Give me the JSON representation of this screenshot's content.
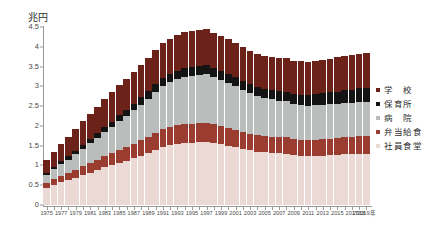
{
  "chart_data": {
    "type": "bar",
    "stacked": true,
    "title": "",
    "subtitle": "",
    "unit_label": "兆円",
    "xlabel": "年",
    "ylabel": "兆円",
    "ylim": [
      0,
      4.5
    ],
    "ytick_labels": [
      "4.5",
      "4",
      "3.5",
      "3",
      "2.5",
      "2",
      "1.5",
      "1",
      "0.5",
      "0"
    ],
    "ytick_values": [
      4.5,
      4,
      3.5,
      3,
      2.5,
      2,
      1.5,
      1,
      0.5,
      0
    ],
    "grid": false,
    "legend_position": "right",
    "x": [
      1975,
      1976,
      1977,
      1978,
      1979,
      1980,
      1981,
      1982,
      1983,
      1984,
      1985,
      1986,
      1987,
      1988,
      1989,
      1990,
      1991,
      1992,
      1993,
      1994,
      1995,
      1996,
      1997,
      1998,
      1999,
      2000,
      2001,
      2002,
      2003,
      2004,
      2005,
      2006,
      2007,
      2008,
      2009,
      2010,
      2011,
      2012,
      2013,
      2014,
      2015,
      2016,
      2017,
      2018,
      2019
    ],
    "xtick_labels": [
      "1975",
      "1977",
      "1979",
      "1981",
      "1983",
      "1985",
      "1987",
      "1989",
      "1991",
      "1993",
      "1995",
      "1997",
      "1999",
      "2001",
      "2003",
      "2005",
      "2007",
      "2009",
      "2011",
      "2013",
      "2015",
      "2017",
      "2018",
      "2019年"
    ],
    "xtick_values": [
      1975,
      1977,
      1979,
      1981,
      1983,
      1985,
      1987,
      1989,
      1991,
      1993,
      1995,
      1997,
      1999,
      2001,
      2003,
      2005,
      2007,
      2009,
      2011,
      2013,
      2015,
      2017,
      2018,
      2019
    ],
    "series": [
      {
        "name": "社員食堂",
        "color": "#ead9d4",
        "values": [
          0.42,
          0.5,
          0.57,
          0.62,
          0.68,
          0.75,
          0.82,
          0.88,
          0.95,
          1.0,
          1.07,
          1.12,
          1.18,
          1.25,
          1.32,
          1.4,
          1.47,
          1.52,
          1.55,
          1.57,
          1.58,
          1.59,
          1.6,
          1.57,
          1.54,
          1.5,
          1.46,
          1.42,
          1.38,
          1.35,
          1.33,
          1.32,
          1.31,
          1.3,
          1.26,
          1.25,
          1.24,
          1.24,
          1.25,
          1.26,
          1.27,
          1.28,
          1.29,
          1.3,
          1.3
        ]
      },
      {
        "name": "弁当給食",
        "color": "#9b3c30",
        "values": [
          0.13,
          0.15,
          0.17,
          0.19,
          0.21,
          0.23,
          0.25,
          0.27,
          0.29,
          0.31,
          0.33,
          0.35,
          0.37,
          0.39,
          0.41,
          0.43,
          0.45,
          0.46,
          0.47,
          0.47,
          0.48,
          0.48,
          0.48,
          0.47,
          0.46,
          0.45,
          0.44,
          0.43,
          0.42,
          0.42,
          0.41,
          0.41,
          0.41,
          0.41,
          0.4,
          0.4,
          0.4,
          0.41,
          0.41,
          0.42,
          0.42,
          0.43,
          0.43,
          0.44,
          0.44
        ]
      },
      {
        "name": "病院",
        "color": "#b9bdbc",
        "values": [
          0.22,
          0.26,
          0.3,
          0.34,
          0.39,
          0.44,
          0.49,
          0.54,
          0.6,
          0.66,
          0.72,
          0.78,
          0.84,
          0.9,
          0.96,
          1.02,
          1.08,
          1.12,
          1.16,
          1.19,
          1.21,
          1.22,
          1.22,
          1.2,
          1.17,
          1.14,
          1.1,
          1.06,
          1.02,
          0.99,
          0.96,
          0.94,
          0.92,
          0.91,
          0.89,
          0.88,
          0.87,
          0.87,
          0.87,
          0.87,
          0.87,
          0.87,
          0.87,
          0.87,
          0.87
        ]
      },
      {
        "name": "保育所",
        "color": "#141414",
        "values": [
          0.05,
          0.06,
          0.07,
          0.08,
          0.09,
          0.1,
          0.11,
          0.12,
          0.13,
          0.14,
          0.15,
          0.16,
          0.17,
          0.18,
          0.19,
          0.2,
          0.21,
          0.22,
          0.22,
          0.23,
          0.23,
          0.23,
          0.23,
          0.23,
          0.23,
          0.23,
          0.23,
          0.23,
          0.23,
          0.23,
          0.23,
          0.24,
          0.24,
          0.25,
          0.25,
          0.26,
          0.27,
          0.28,
          0.29,
          0.3,
          0.31,
          0.32,
          0.33,
          0.34,
          0.35
        ]
      },
      {
        "name": "学　校",
        "color": "#6d2219",
        "values": [
          0.32,
          0.38,
          0.44,
          0.5,
          0.55,
          0.6,
          0.64,
          0.68,
          0.71,
          0.74,
          0.76,
          0.78,
          0.8,
          0.82,
          0.84,
          0.86,
          0.88,
          0.89,
          0.9,
          0.91,
          0.91,
          0.91,
          0.91,
          0.89,
          0.88,
          0.87,
          0.86,
          0.85,
          0.84,
          0.84,
          0.84,
          0.84,
          0.84,
          0.84,
          0.84,
          0.84,
          0.84,
          0.84,
          0.85,
          0.85,
          0.86,
          0.86,
          0.87,
          0.87,
          0.88
        ]
      }
    ],
    "totals": [
      1.14,
      1.35,
      1.55,
      1.73,
      1.92,
      2.12,
      2.31,
      2.49,
      2.68,
      2.85,
      3.03,
      3.19,
      3.36,
      3.54,
      3.72,
      3.91,
      4.09,
      4.21,
      4.3,
      4.37,
      4.41,
      4.43,
      4.44,
      4.36,
      4.28,
      4.19,
      4.09,
      3.99,
      3.89,
      3.83,
      3.77,
      3.75,
      3.72,
      3.71,
      3.64,
      3.63,
      3.62,
      3.64,
      3.67,
      3.7,
      3.73,
      3.76,
      3.79,
      3.82,
      3.84
    ]
  },
  "legend": {
    "items": [
      {
        "label": "学　校",
        "color": "#6d2219"
      },
      {
        "label": "保育所",
        "color": "#141414"
      },
      {
        "label": "病　院",
        "color": "#b9bdbc"
      },
      {
        "label": "弁当給食",
        "color": "#9b3c30"
      },
      {
        "label": "社員食堂",
        "color": "#ead9d4"
      }
    ]
  },
  "axes": {
    "unit_label": "兆円"
  }
}
